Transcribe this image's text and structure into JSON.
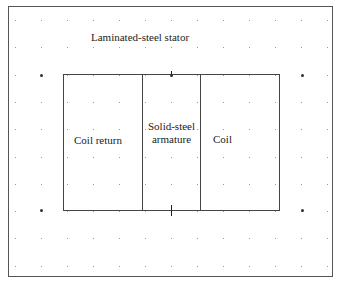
{
  "diagram": {
    "type": "magnetic-actuator-cross-section",
    "labels": {
      "stator": "Laminated-steel stator",
      "coil_return": "Coil return",
      "armature_line1": "Solid-steel",
      "armature_line2": "armature",
      "coil": "Coil"
    },
    "regions": [
      {
        "name": "Laminated-steel stator",
        "role": "outer frame"
      },
      {
        "name": "Coil return",
        "role": "left cell"
      },
      {
        "name": "Solid-steel armature",
        "role": "center cell"
      },
      {
        "name": "Coil",
        "role": "right cell"
      }
    ],
    "grid": {
      "style": "dotted",
      "x_start": 15,
      "x_spacing": 26,
      "columns": 13,
      "y_start": 20,
      "y_spacing": 27.3,
      "rows": 10
    },
    "markers": [
      {
        "x": 41,
        "y": 75
      },
      {
        "x": 171,
        "y": 75
      },
      {
        "x": 302,
        "y": 75
      },
      {
        "x": 41,
        "y": 210
      },
      {
        "x": 302,
        "y": 210
      }
    ],
    "colors": {
      "line": "#444444",
      "grid_dot": "#9a9a9a",
      "text": "#222222",
      "background": "#ffffff"
    }
  }
}
